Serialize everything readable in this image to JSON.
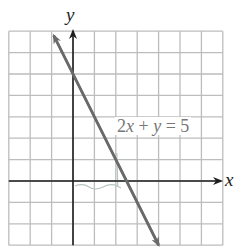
{
  "chart_data": {
    "type": "line",
    "title": "",
    "xlabel": "x",
    "ylabel": "y",
    "equation": "2x + y = 5",
    "series": [
      {
        "name": "2x + y = 5",
        "slope": -2,
        "intercept": 5,
        "x": [
          -0.9,
          0,
          1,
          2,
          2.5,
          3,
          4
        ],
        "y": [
          6.8,
          5,
          3,
          1,
          0,
          -1,
          -3
        ]
      }
    ],
    "xlim": [
      -3,
      7
    ],
    "ylim": [
      -3,
      7
    ],
    "grid": true,
    "grid_step": 1,
    "tick_labels": false,
    "intercepts": {
      "y_intercept": [
        0,
        5
      ],
      "x_intercept": [
        2.5,
        0
      ]
    }
  },
  "labels": {
    "x_axis": "x",
    "y_axis": "y",
    "equation_parts": [
      "2",
      "x",
      " + ",
      "y",
      " = 5"
    ]
  },
  "colors": {
    "grid": "#bdbdbd",
    "axes": "#1e1e1e",
    "line": "#6a6a6a",
    "label": "#7a7a7a",
    "pencil_mark": "#b8c4c0"
  }
}
